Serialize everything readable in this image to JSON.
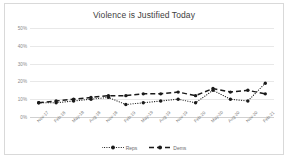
{
  "chart_data": {
    "type": "line",
    "title": "Violence is Justified Today",
    "xlabel": "",
    "ylabel": "",
    "ylim": [
      0,
      50
    ],
    "yticks": [
      "0%",
      "10%",
      "20%",
      "30%",
      "40%",
      "50%"
    ],
    "ytick_values": [
      0,
      10,
      20,
      30,
      40,
      50
    ],
    "grid": true,
    "legend_position": "bottom",
    "categories": [
      "Nov-17",
      "Feb-18",
      "May-18",
      "Aug-18",
      "Nov-18",
      "Feb-19",
      "May-19",
      "Aug-19",
      "Nov-19",
      "Feb-20",
      "May-20",
      "Aug-20",
      "Nov-20",
      "Feb-21"
    ],
    "series": [
      {
        "name": "Reps",
        "style": "dotted",
        "marker": "circle",
        "color": "#1a1a1a",
        "values": [
          8,
          8,
          9,
          10,
          11,
          7,
          8,
          9,
          10,
          8,
          15,
          10,
          9,
          19
        ]
      },
      {
        "name": "Dems",
        "style": "dashed",
        "marker": "circle",
        "color": "#1a1a1a",
        "values": [
          8,
          9,
          10,
          11,
          12,
          12,
          13,
          13,
          14,
          12,
          16,
          14,
          15,
          13
        ]
      }
    ]
  },
  "legend": {
    "items": [
      {
        "label": "Reps"
      },
      {
        "label": "Dems"
      }
    ]
  }
}
